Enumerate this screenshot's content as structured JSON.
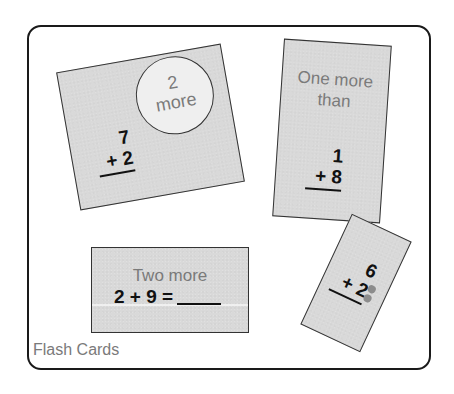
{
  "figure": {
    "caption": "Flash Cards"
  },
  "cards": [
    {
      "id": "card-2-more",
      "badge": {
        "line1": "2",
        "line2": "more"
      },
      "top_number": "7",
      "addend": "+ 2"
    },
    {
      "id": "card-one-more-than",
      "prompt_line1": "One more",
      "prompt_line2": "than",
      "top_number": "1",
      "addend": "+ 8"
    },
    {
      "id": "card-two-more",
      "prompt": "Two more",
      "equation": "2 + 9 ="
    },
    {
      "id": "card-dots",
      "top_number": "6",
      "addend": "+ 2",
      "dot_count": 2
    }
  ],
  "colors": {
    "card_fill": "#d9d9d9",
    "badge_fill": "#efefef",
    "prompt_text": "#7a7a7a",
    "number_text": "#111111",
    "dot": "#8c8c8c"
  }
}
